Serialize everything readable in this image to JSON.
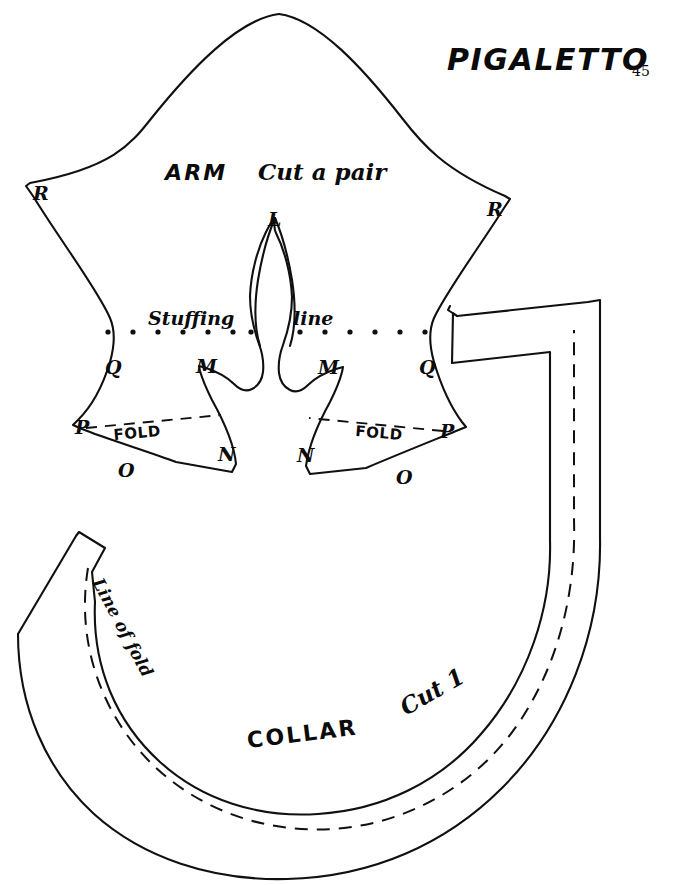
{
  "page": {
    "title": "PIGALETTO",
    "page_number": "45",
    "background_color": "#ffffff",
    "ink_color": "#101010",
    "width": 678,
    "height": 885
  },
  "arm_piece": {
    "part_label": "ARM",
    "cut_note": "Cut a pair",
    "stuffing_line_label_left": "Stuffing",
    "stuffing_line_label_right": "line",
    "fold_label_left": "FOLD",
    "fold_label_right": "FOLD",
    "vertices": [
      {
        "id": "R-left",
        "label": "R",
        "x": 40,
        "y": 193
      },
      {
        "id": "R-right",
        "label": "R",
        "x": 494,
        "y": 209
      },
      {
        "id": "L",
        "label": "L",
        "x": 274,
        "y": 219
      },
      {
        "id": "Q-left",
        "label": "Q",
        "x": 112,
        "y": 367
      },
      {
        "id": "M-left",
        "label": "M",
        "x": 203,
        "y": 366
      },
      {
        "id": "M-right",
        "label": "M",
        "x": 324,
        "y": 367
      },
      {
        "id": "Q-right",
        "label": "Q",
        "x": 426,
        "y": 367
      },
      {
        "id": "P-left",
        "label": "P",
        "x": 82,
        "y": 427
      },
      {
        "id": "P-right",
        "label": "P",
        "x": 446,
        "y": 431
      },
      {
        "id": "N-left",
        "label": "N",
        "x": 224,
        "y": 454
      },
      {
        "id": "N-right",
        "label": "N",
        "x": 303,
        "y": 455
      },
      {
        "id": "O-left",
        "label": "O",
        "x": 124,
        "y": 470
      },
      {
        "id": "O-right",
        "label": "O",
        "x": 402,
        "y": 477
      }
    ]
  },
  "collar_piece": {
    "part_label": "COLLAR",
    "cut_note": "Cut 1",
    "line_of_fold_label": "Line of fold"
  }
}
